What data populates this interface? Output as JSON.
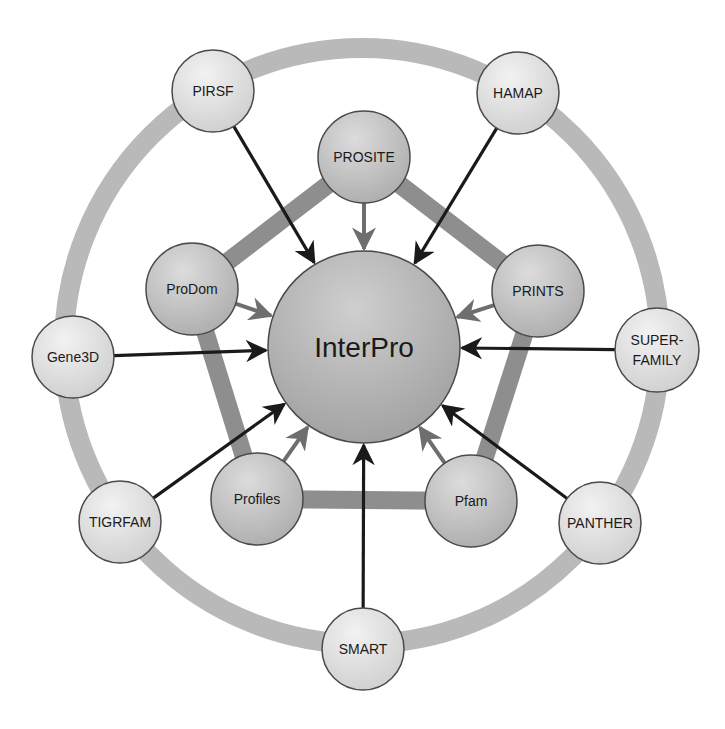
{
  "diagram": {
    "colors": {
      "background": "#ffffff",
      "outer_ring": "#b9b9b9",
      "pentagon": "#8e8e8e",
      "outer_arrow": "#1a1a1a",
      "inner_arrow": "#6e6e6e",
      "node_stroke": "#4a4a4a",
      "outer_node_fill": "#dedede",
      "inner_node_fill": "#c4c4c4",
      "center_fill": "#b4b4b4"
    },
    "center": {
      "id": "interpro",
      "label": "InterPro",
      "x": 364,
      "y": 347,
      "r": 96
    },
    "outer_ring": {
      "x": 362,
      "y": 346,
      "r": 298,
      "width": 20
    },
    "inner_nodes": [
      {
        "id": "prosite",
        "label": "PROSITE",
        "x": 364,
        "y": 157,
        "r": 46
      },
      {
        "id": "prints",
        "label": "PRINTS",
        "x": 538,
        "y": 291,
        "r": 46
      },
      {
        "id": "pfam",
        "label": "Pfam",
        "x": 471,
        "y": 501,
        "r": 46
      },
      {
        "id": "profiles",
        "label": "Profiles",
        "x": 257,
        "y": 499,
        "r": 46
      },
      {
        "id": "prodom",
        "label": "ProDom",
        "x": 192,
        "y": 289,
        "r": 46
      }
    ],
    "outer_nodes": [
      {
        "id": "pirsf",
        "label": "PIRSF",
        "lines": [
          "PIRSF"
        ],
        "x": 213,
        "y": 91,
        "r": 41
      },
      {
        "id": "hamap",
        "label": "HAMAP",
        "lines": [
          "HAMAP"
        ],
        "x": 518,
        "y": 93,
        "r": 41
      },
      {
        "id": "superfamily",
        "label": "SUPER-FAMILY",
        "lines": [
          "SUPER-",
          "FAMILY"
        ],
        "x": 657,
        "y": 350,
        "r": 42
      },
      {
        "id": "panther",
        "label": "PANTHER",
        "lines": [
          "PANTHER"
        ],
        "x": 600,
        "y": 523,
        "r": 41
      },
      {
        "id": "smart",
        "label": "SMART",
        "lines": [
          "SMART"
        ],
        "x": 363,
        "y": 649,
        "r": 41
      },
      {
        "id": "tigrfam",
        "label": "TIGRFAM",
        "lines": [
          "TIGRFAM"
        ],
        "x": 120,
        "y": 522,
        "r": 41
      },
      {
        "id": "gene3d",
        "label": "Gene3D",
        "lines": [
          "Gene3D"
        ],
        "x": 73,
        "y": 357,
        "r": 41
      }
    ],
    "edges_note": "All member databases point with arrows into InterPro; inner five are connected by a pentagon band; outer seven sit on a ring."
  }
}
